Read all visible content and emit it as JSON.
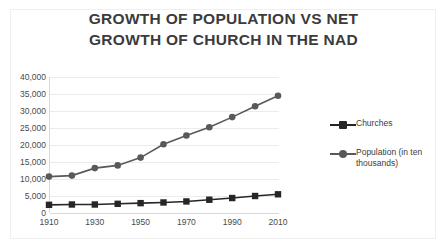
{
  "chart_data": {
    "type": "line",
    "title": "GROWTH OF POPULATION VS NET GROWTH OF CHURCH IN THE NAD",
    "title_lines": [
      "GROWTH OF POPULATION VS NET",
      "GROWTH OF CHURCH IN THE NAD"
    ],
    "xlabel": "",
    "ylabel": "",
    "x": [
      1910,
      1920,
      1930,
      1940,
      1950,
      1960,
      1970,
      1980,
      1990,
      2000,
      2010
    ],
    "xtick_labels": [
      "1910",
      "1930",
      "1950",
      "1970",
      "1990",
      "2010"
    ],
    "xtick_values": [
      1910,
      1930,
      1950,
      1970,
      1990,
      2010
    ],
    "xlim": [
      1910,
      2010
    ],
    "ytick_labels": [
      "0",
      "5,000",
      "10,000",
      "15,000",
      "20,000",
      "25,000",
      "30,000",
      "35,000",
      "40,000"
    ],
    "ytick_values": [
      0,
      5000,
      10000,
      15000,
      20000,
      25000,
      30000,
      35000,
      40000
    ],
    "ylim": [
      0,
      40000
    ],
    "grid": true,
    "legend_position": "right",
    "series": [
      {
        "name": "Churches",
        "color": "#262626",
        "marker": "square",
        "values": [
          2400,
          2500,
          2500,
          2700,
          2900,
          3100,
          3400,
          3900,
          4400,
          5000,
          5500
        ]
      },
      {
        "name": "Population (in ten thousands)",
        "color": "#595959",
        "marker": "circle",
        "values": [
          10700,
          11000,
          13200,
          14000,
          16300,
          20200,
          22800,
          25200,
          28200,
          31400,
          34500
        ]
      }
    ]
  },
  "legend": {
    "entries": [
      {
        "label": "Churches"
      },
      {
        "label": "Population (in ten thousands)"
      }
    ]
  }
}
